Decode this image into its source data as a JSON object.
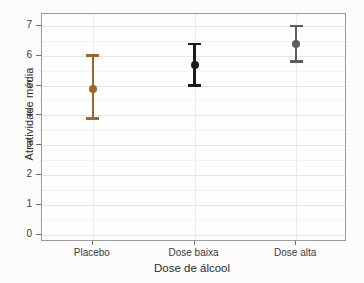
{
  "chart_data": {
    "type": "scatter",
    "title": "",
    "xlabel": "Dose de álcool",
    "ylabel": "Atratividade média",
    "categories": [
      "Placebo",
      "Dose baixa",
      "Dose alta"
    ],
    "ylim": [
      -0.25,
      7.4
    ],
    "yticks": [
      0,
      1,
      2,
      3,
      4,
      5,
      6,
      7
    ],
    "ytick_labels": [
      "0",
      "1",
      "2",
      "3",
      "4",
      "5",
      "6",
      "7"
    ],
    "grid": true,
    "legend": "none",
    "series": [
      {
        "name": "Atratividade média",
        "values": [
          4.9,
          5.7,
          6.4
        ],
        "error_low": [
          3.9,
          5.0,
          5.8
        ],
        "error_high": [
          6.0,
          6.4,
          7.0
        ],
        "colors": [
          "#a2642c",
          "#1b1b1b",
          "#5e5e5e"
        ]
      }
    ],
    "points": [
      {
        "category": "Placebo",
        "mean": 4.9,
        "ci_low": 3.9,
        "ci_high": 6.0,
        "color": "#a2642c"
      },
      {
        "category": "Dose baixa",
        "mean": 5.7,
        "ci_low": 5.0,
        "ci_high": 6.4,
        "color": "#1b1b1b"
      },
      {
        "category": "Dose alta",
        "mean": 6.4,
        "ci_low": 5.8,
        "ci_high": 7.0,
        "color": "#5e5e5e"
      }
    ]
  },
  "colors": {
    "background": "#ffffff",
    "frame": "#9a9a9a",
    "grid_major": "#e3e6ea",
    "grid_minor": "#f1f3f6",
    "text": "#2b2b2b"
  }
}
